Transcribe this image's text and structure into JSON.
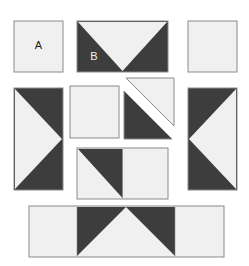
{
  "figure": {
    "title": "",
    "type": "geometric-piece-layout",
    "background_color": "#ffffff",
    "dark_color": "#3d3d3d",
    "light_color": "#f0f0f0",
    "outline_color": "#8a8a8a",
    "width": 249,
    "height": 266,
    "unit": 49
  },
  "labels": {
    "a": "A",
    "b": "B"
  },
  "pieces": [
    {
      "id": "piece-a-square",
      "name": "plain-light-square-a",
      "label": "A",
      "x": 14,
      "y": 21,
      "w": 49,
      "h": 51,
      "fill": "light",
      "shapes": []
    },
    {
      "id": "piece-b-double-triangle",
      "name": "double-rectangle-b-downward-light-triangle",
      "label": "B",
      "x": 77,
      "y": 21,
      "w": 91,
      "h": 51,
      "fill": "dark",
      "shapes": [
        {
          "name": "light-triangle-pointing-down",
          "fill": "light"
        }
      ]
    },
    {
      "id": "piece-top-right-square",
      "name": "plain-light-square-top-right",
      "label": "",
      "x": 188,
      "y": 21,
      "w": 49,
      "h": 51,
      "fill": "light",
      "shapes": []
    },
    {
      "id": "piece-left-tall",
      "name": "tall-dark-rectangle-right-pointing-light-triangle",
      "label": "",
      "x": 14,
      "y": 88,
      "w": 49,
      "h": 102,
      "fill": "dark",
      "shapes": [
        {
          "name": "light-triangle-pointing-right",
          "fill": "light"
        }
      ]
    },
    {
      "id": "piece-center-square",
      "name": "plain-light-square-center",
      "label": "",
      "x": 70,
      "y": 86,
      "w": 49,
      "h": 52,
      "fill": "light",
      "shapes": []
    },
    {
      "id": "piece-split-light-triangle",
      "name": "light-half-square-triangle-upper-right",
      "label": "",
      "x": 124,
      "y": 77,
      "w": 50,
      "h": 50,
      "fill": "light",
      "shapes": []
    },
    {
      "id": "piece-split-dark-triangle",
      "name": "dark-half-square-triangle-lower-left",
      "label": "",
      "x": 124,
      "y": 90,
      "w": 50,
      "h": 50,
      "fill": "dark",
      "shapes": []
    },
    {
      "id": "piece-right-tall",
      "name": "tall-dark-rectangle-left-pointing-light-triangle",
      "label": "",
      "x": 188,
      "y": 88,
      "w": 49,
      "h": 102,
      "fill": "dark",
      "shapes": [
        {
          "name": "light-triangle-pointing-left",
          "fill": "light"
        }
      ]
    },
    {
      "id": "piece-center-lower-double",
      "name": "double-rectangle-dark-upper-right-triangle-plus-light-square",
      "label": "",
      "x": 77,
      "y": 148,
      "w": 91,
      "h": 51,
      "fill": "light",
      "shapes": [
        {
          "name": "dark-triangle-upper-right",
          "fill": "dark"
        }
      ]
    },
    {
      "id": "piece-bottom-wide",
      "name": "wide-rectangle-light-ends-dark-center-upward-light-triangle",
      "label": "",
      "x": 29,
      "y": 206,
      "w": 195,
      "h": 51,
      "fill": "light",
      "shapes": [
        {
          "name": "dark-center-band",
          "fill": "dark"
        },
        {
          "name": "light-triangle-pointing-up",
          "fill": "light"
        }
      ]
    }
  ]
}
